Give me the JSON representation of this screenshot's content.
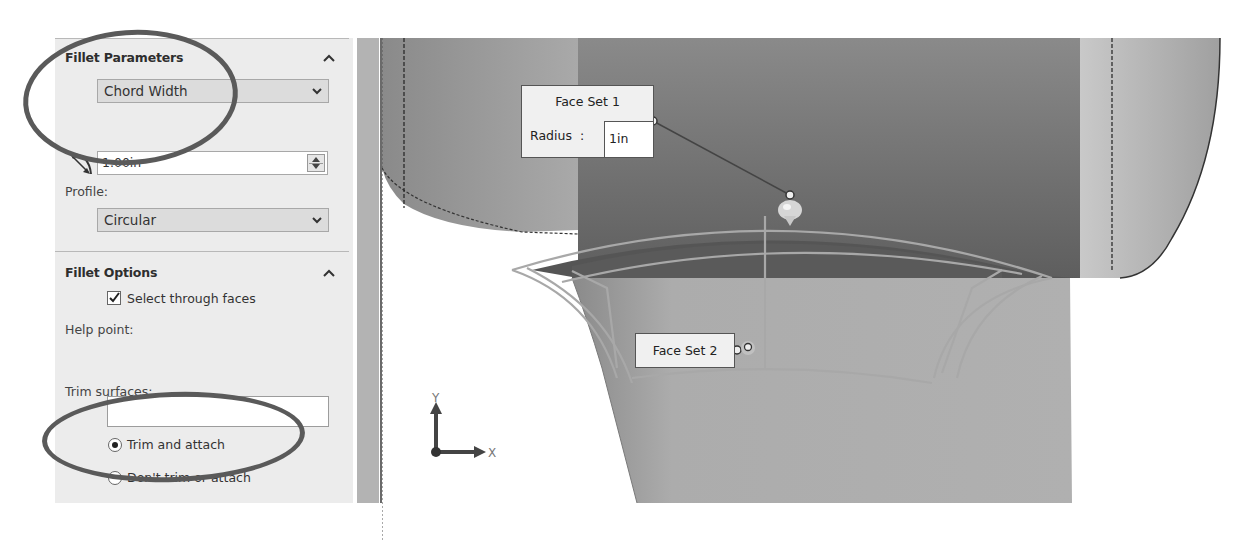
{
  "property_manager": {
    "fillet_parameters": {
      "header": "Fillet Parameters",
      "collapse_icon": "chevron-up-icon",
      "method_dropdown": {
        "selected": "Chord Width"
      },
      "chord_width_icon": "chord-width-icon",
      "chord_width_input": {
        "value": "1.00in"
      },
      "profile_label": "Profile:",
      "profile_dropdown": {
        "selected": "Circular"
      }
    },
    "fillet_options": {
      "header": "Fillet Options",
      "collapse_icon": "chevron-up-icon",
      "select_through_faces": {
        "label": "Select through faces",
        "checked": true
      },
      "help_point_label": "Help point:",
      "help_point_value": "",
      "trim_surfaces_label": "Trim surfaces:",
      "trim_options": [
        {
          "label": "Trim and attach",
          "selected": true
        },
        {
          "label": "Don't trim or attach",
          "selected": false
        }
      ]
    }
  },
  "viewport": {
    "face_set_1": {
      "title": "Face Set 1",
      "radius_label": "Radius",
      "separator": ":",
      "radius_value": "1in"
    },
    "face_set_2": {
      "title": "Face Set 2"
    },
    "triad": {
      "x_label": "X",
      "y_label": "Y"
    }
  },
  "colors": {
    "panel_bg": "#ececec",
    "annotation_ellipse": "#5a5a5a",
    "model_dark": "#6e6e6e",
    "model_light": "#b5b5b5"
  }
}
